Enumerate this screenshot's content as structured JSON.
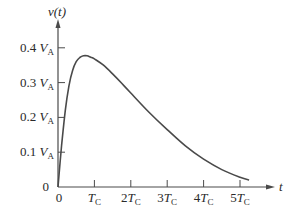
{
  "chart_data": {
    "type": "line",
    "title": "",
    "xlabel": "t",
    "ylabel": "v(t)",
    "x_unit": "T_C",
    "y_unit": "V_A",
    "xlim": [
      0,
      5.2
    ],
    "ylim": [
      0,
      0.45
    ],
    "grid": false,
    "legend": null,
    "x_ticks": [
      {
        "value": 0,
        "label": "0"
      },
      {
        "value": 1,
        "label": "T",
        "sub": "C"
      },
      {
        "value": 2,
        "label": "2T",
        "sub": "C"
      },
      {
        "value": 3,
        "label": "3T",
        "sub": "C"
      },
      {
        "value": 4,
        "label": "4T",
        "sub": "C"
      },
      {
        "value": 5,
        "label": "5T",
        "sub": "C"
      }
    ],
    "y_ticks": [
      {
        "value": 0,
        "label": "0"
      },
      {
        "value": 0.1,
        "label": "0.1 V",
        "sub": "A"
      },
      {
        "value": 0.2,
        "label": "0.2 V",
        "sub": "A"
      },
      {
        "value": 0.3,
        "label": "0.3 V",
        "sub": "A"
      },
      {
        "value": 0.4,
        "label": "0.4 V",
        "sub": "A"
      }
    ],
    "series": [
      {
        "name": "v(t)",
        "x": [
          0,
          0.1,
          0.2,
          0.3,
          0.4,
          0.5,
          0.6,
          0.7,
          0.8,
          0.9,
          1.0,
          1.25,
          1.5,
          1.75,
          2.0,
          2.5,
          3.0,
          3.5,
          4.0,
          4.5,
          5.0,
          5.25
        ],
        "y": [
          0,
          0.12,
          0.22,
          0.29,
          0.335,
          0.36,
          0.372,
          0.377,
          0.377,
          0.373,
          0.368,
          0.35,
          0.325,
          0.298,
          0.27,
          0.215,
          0.165,
          0.118,
          0.08,
          0.05,
          0.028,
          0.02
        ]
      }
    ]
  },
  "axes": {
    "y_title": "v(t)",
    "x_title": "t"
  }
}
